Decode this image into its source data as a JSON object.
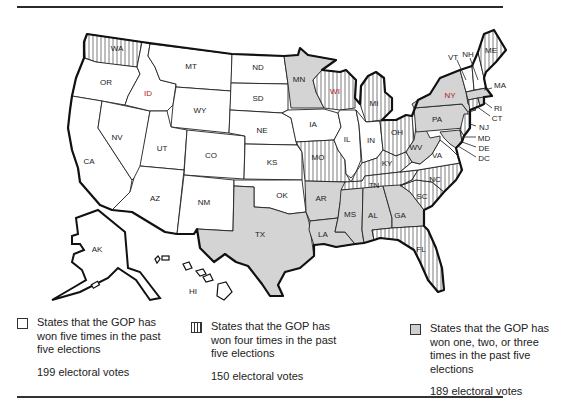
{
  "map": {
    "title": "",
    "states": {
      "WA": {
        "label": "WA",
        "category": "four"
      },
      "OR": {
        "label": "OR",
        "category": "five"
      },
      "CA": {
        "label": "CA",
        "category": "five"
      },
      "ID": {
        "label": "ID",
        "category": "five"
      },
      "NV": {
        "label": "NV",
        "category": "five"
      },
      "MT": {
        "label": "MT",
        "category": "five"
      },
      "WY": {
        "label": "WY",
        "category": "five"
      },
      "UT": {
        "label": "UT",
        "category": "five"
      },
      "CO": {
        "label": "CO",
        "category": "five"
      },
      "AZ": {
        "label": "AZ",
        "category": "five"
      },
      "NM": {
        "label": "NM",
        "category": "five"
      },
      "ND": {
        "label": "ND",
        "category": "five"
      },
      "SD": {
        "label": "SD",
        "category": "five"
      },
      "NE": {
        "label": "NE",
        "category": "five"
      },
      "KS": {
        "label": "KS",
        "category": "five"
      },
      "OK": {
        "label": "OK",
        "category": "five"
      },
      "TX": {
        "label": "TX",
        "category": "one_to_three"
      },
      "MN": {
        "label": "MN",
        "category": "one_to_three"
      },
      "IA": {
        "label": "IA",
        "category": "five"
      },
      "MO": {
        "label": "MO",
        "category": "four"
      },
      "AR": {
        "label": "AR",
        "category": "one_to_three"
      },
      "LA": {
        "label": "LA",
        "category": "one_to_three"
      },
      "WI": {
        "label": "WI",
        "category": "four"
      },
      "IL": {
        "label": "IL",
        "category": "five"
      },
      "MI": {
        "label": "MI",
        "category": "four"
      },
      "IN": {
        "label": "IN",
        "category": "five"
      },
      "OH": {
        "label": "OH",
        "category": "four"
      },
      "KY": {
        "label": "KY",
        "category": "four"
      },
      "TN": {
        "label": "TN",
        "category": "four"
      },
      "MS": {
        "label": "MS",
        "category": "one_to_three"
      },
      "AL": {
        "label": "AL",
        "category": "one_to_three"
      },
      "GA": {
        "label": "GA",
        "category": "one_to_three"
      },
      "FL": {
        "label": "FL",
        "category": "four"
      },
      "SC": {
        "label": "SC",
        "category": "four"
      },
      "NC": {
        "label": "NC",
        "category": "four"
      },
      "VA": {
        "label": "VA",
        "category": "five"
      },
      "WV": {
        "label": "WV",
        "category": "one_to_three"
      },
      "PA": {
        "label": "PA",
        "category": "one_to_three"
      },
      "NY": {
        "label": "NY",
        "category": "one_to_three"
      },
      "VT": {
        "label": "VT",
        "category": "five"
      },
      "NH": {
        "label": "NH",
        "category": "five"
      },
      "ME": {
        "label": "ME",
        "category": "four"
      },
      "MA": {
        "label": "MA",
        "category": "one_to_three"
      },
      "RI": {
        "label": "RI",
        "category": "one_to_three"
      },
      "CT": {
        "label": "CT",
        "category": "four"
      },
      "NJ": {
        "label": "NJ",
        "category": "four"
      },
      "MD": {
        "label": "MD",
        "category": "one_to_three"
      },
      "DE": {
        "label": "DE",
        "category": "four"
      },
      "DC": {
        "label": "DC",
        "category": "one_to_three"
      },
      "AK": {
        "label": "AK",
        "category": "five"
      },
      "HI": {
        "label": "HI",
        "category": "one_to_three"
      }
    },
    "colors": {
      "five": "#ffffff",
      "four": "vertical-hatch",
      "one_to_three": "#d4d4d4",
      "outline": "#111111"
    }
  },
  "legend": [
    {
      "swatch": "white",
      "text": "States that the GOP has won five times in the past five elections",
      "lines": [
        "States that the GOP has",
        "won five times in the past",
        "five elections"
      ],
      "votes": "199 electoral votes"
    },
    {
      "swatch": "hatch",
      "text": "States that the GOP has won four times in the past five elections",
      "lines": [
        "States that the GOP has",
        "won four times in the past",
        "five elections"
      ],
      "votes": "150 electoral votes"
    },
    {
      "swatch": "gray",
      "text": "States that the GOP has won one, two, or three times in the past five elections",
      "lines": [
        "States that the GOP has",
        "won one, two, or three",
        "times in the past five",
        "elections"
      ],
      "votes": "189 electoral votes"
    }
  ]
}
